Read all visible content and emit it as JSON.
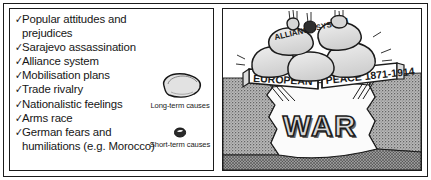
{
  "figure": {
    "title": "Causes of the First World War diagram",
    "border_color": "#1b1b1b",
    "background": "#ffffff"
  },
  "list_panel": {
    "name": "causes-list",
    "bullet_glyph": "✓",
    "items": [
      {
        "label": "Popular attitudes and prejudices"
      },
      {
        "label": "Sarajevo assassination"
      },
      {
        "label": "Alliance system"
      },
      {
        "label": "Mobilisation plans"
      },
      {
        "label": "Trade rivalry"
      },
      {
        "label": "Nationalistic feelings"
      },
      {
        "label": "Arms race"
      },
      {
        "label": "German fears and humiliations (e.g. Morocco)"
      }
    ]
  },
  "legend": {
    "long_term": {
      "label": "Long-term causes",
      "symbol": "large-rock"
    },
    "short_term": {
      "label": "Short-term causes",
      "symbol": "small-pebble"
    }
  },
  "illustration": {
    "name": "peace-bridge-collapsing-cartoon",
    "rock_label": "ALLIANCE SYSTEM",
    "banner_left": "EUROPEAN",
    "banner_right": "PEACE 1871-1914",
    "chasm_label": "WAR",
    "colors": {
      "ink": "#1b1b1b",
      "rock_fill": "#e2e2e2",
      "ground_fill": "#a8a8a8",
      "banner_fill": "#ffffff",
      "chasm_fill": "#fbfbfb"
    }
  }
}
